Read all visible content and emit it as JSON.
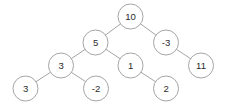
{
  "figure": {
    "type": "binary-tree",
    "width": 225,
    "height": 111,
    "background_color": "#ffffff",
    "node_fill_color": "#ffffff",
    "node_stroke_color": "#9a9a9a",
    "edge_color": "#9a9a9a",
    "label_color": "#2b2b2b",
    "node_radius": 12.5
  },
  "chart_data": {
    "type": "diagram",
    "root": "n-root-10",
    "nodes": [
      {
        "id": "n-root-10",
        "label": "10",
        "x": 130.5,
        "y": 16.5,
        "depth": 0
      },
      {
        "id": "n-5",
        "label": "5",
        "x": 95.5,
        "y": 42.5,
        "depth": 1
      },
      {
        "id": "n-neg3",
        "label": "-3",
        "x": 166.0,
        "y": 42.5,
        "depth": 1
      },
      {
        "id": "n-3-inner",
        "label": "3",
        "x": 61.0,
        "y": 65.5,
        "depth": 2
      },
      {
        "id": "n-1",
        "label": "1",
        "x": 130.5,
        "y": 65.5,
        "depth": 2
      },
      {
        "id": "n-11",
        "label": "11",
        "x": 201.0,
        "y": 65.5,
        "depth": 2
      },
      {
        "id": "n-3-leaf",
        "label": "3",
        "x": 25.5,
        "y": 88.5,
        "depth": 3
      },
      {
        "id": "n-neg2",
        "label": "-2",
        "x": 96.0,
        "y": 88.5,
        "depth": 3
      },
      {
        "id": "n-2",
        "label": "2",
        "x": 166.0,
        "y": 88.5,
        "depth": 3
      }
    ],
    "edges": [
      {
        "id": "e-10-5",
        "from": "n-root-10",
        "to": "n-5",
        "side": "left"
      },
      {
        "id": "e-10-neg3",
        "from": "n-root-10",
        "to": "n-neg3",
        "side": "right"
      },
      {
        "id": "e-5-3",
        "from": "n-5",
        "to": "n-3-inner",
        "side": "left"
      },
      {
        "id": "e-5-1",
        "from": "n-5",
        "to": "n-1",
        "side": "right"
      },
      {
        "id": "e-neg3-11",
        "from": "n-neg3",
        "to": "n-11",
        "side": "right"
      },
      {
        "id": "e-3-3",
        "from": "n-3-inner",
        "to": "n-3-leaf",
        "side": "left"
      },
      {
        "id": "e-3-neg2",
        "from": "n-3-inner",
        "to": "n-neg2",
        "side": "right"
      },
      {
        "id": "e-1-2",
        "from": "n-1",
        "to": "n-2",
        "side": "right"
      }
    ]
  }
}
